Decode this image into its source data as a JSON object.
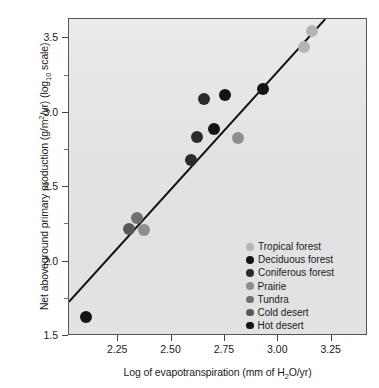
{
  "chart_data": {
    "type": "scatter",
    "title": "",
    "xlabel": "Log of evapotranspiration (mm of H2O/yr)",
    "ylabel": "Net aboveground primary production (g/m2/yr) (log10 scale)",
    "xlim": [
      2.02,
      3.42
    ],
    "ylim": [
      1.5,
      3.63
    ],
    "xticks": [
      "2.25",
      "2.50",
      "2.75",
      "3.00",
      "3.25"
    ],
    "xtick_values": [
      2.25,
      2.5,
      2.75,
      3.0,
      3.25
    ],
    "yticks": [
      "1.5",
      "2.0",
      "2.5",
      "3.0",
      "3.5"
    ],
    "ytick_values": [
      1.5,
      2.0,
      2.5,
      3.0,
      3.5
    ],
    "yticks_minor": [
      1.75,
      2.25,
      2.75,
      3.25
    ],
    "grid": false,
    "legend_position": "inside-lower-right",
    "trendline": {
      "label": "linear regression",
      "x": [
        2.02,
        3.22
      ],
      "y": [
        1.73,
        3.63
      ],
      "color": "#111111"
    },
    "series": [
      {
        "name": "Tropical forest",
        "color": "#b4b4b4",
        "points": [
          {
            "x": 3.16,
            "y": 3.55
          },
          {
            "x": 3.12,
            "y": 3.44
          }
        ]
      },
      {
        "name": "Deciduous forest",
        "color": "#141414",
        "points": [
          {
            "x": 2.93,
            "y": 3.16
          },
          {
            "x": 2.75,
            "y": 3.12
          },
          {
            "x": 2.7,
            "y": 2.89
          }
        ]
      },
      {
        "name": "Coniferous forest",
        "color": "#2b2b2b",
        "points": [
          {
            "x": 2.65,
            "y": 3.09
          },
          {
            "x": 2.62,
            "y": 2.84
          },
          {
            "x": 2.59,
            "y": 2.68
          }
        ]
      },
      {
        "name": "Prairie",
        "color": "#8e8e8e",
        "points": [
          {
            "x": 2.81,
            "y": 2.83
          },
          {
            "x": 2.37,
            "y": 2.21
          }
        ]
      },
      {
        "name": "Tundra",
        "color": "#707070",
        "points": [
          {
            "x": 2.34,
            "y": 2.29
          }
        ]
      },
      {
        "name": "Cold desert",
        "color": "#585858",
        "points": [
          {
            "x": 2.3,
            "y": 2.22
          }
        ]
      },
      {
        "name": "Hot desert",
        "color": "#141414",
        "points": [
          {
            "x": 2.1,
            "y": 1.63
          }
        ]
      }
    ]
  },
  "axes": {
    "ylabel_parts": {
      "a": "Net aboveground primary production (g/m",
      "sup": "2",
      "b": "/yr) (log",
      "sub": "10",
      "c": " scale)"
    },
    "xlabel_parts": {
      "a": "Log of evapotranspiration (mm of H",
      "sub": "2",
      "b": "O/yr)"
    }
  },
  "legend": {
    "entries": [
      {
        "label": "Tropical forest",
        "color": "#b4b4b4",
        "size": 8.0
      },
      {
        "label": "Deciduous forest",
        "color": "#141414",
        "size": 8.0
      },
      {
        "label": "Coniferous forest",
        "color": "#2b2b2b",
        "size": 8.0
      },
      {
        "label": "Prairie",
        "color": "#8e8e8e",
        "size": 7.5
      },
      {
        "label": "Tundra",
        "color": "#707070",
        "size": 7.5
      },
      {
        "label": "Cold desert",
        "color": "#585858",
        "size": 7.5
      },
      {
        "label": "Hot desert",
        "color": "#141414",
        "size": 7.5
      }
    ]
  },
  "style": {
    "plot_background": "#e2e2e2",
    "frame_color": "#555555",
    "text_color": "#1a1a1a",
    "point_radius": 6.0
  }
}
